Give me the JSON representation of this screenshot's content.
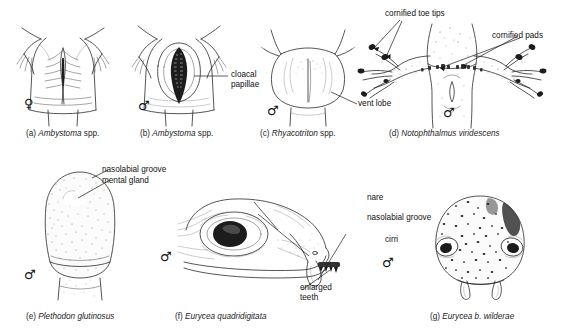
{
  "figure": {
    "background_color": "#ffffff",
    "ink_color": "#2a2a2a",
    "panel_count": 7
  },
  "panels": [
    {
      "id": "a",
      "tag": "(a)",
      "species": "Ambystoma",
      "qualifier": " spp.",
      "caption_tag": "(a)",
      "sex_symbol": "♀",
      "sex": "female",
      "labels": []
    },
    {
      "id": "b",
      "tag": "(b)",
      "species": "Ambystoma",
      "qualifier": " spp.",
      "caption_tag": "(b)",
      "sex_symbol": "♂",
      "sex": "male",
      "labels": [
        {
          "text_line1": "cloacal",
          "text_line2": "papillae",
          "full": "cloacal papillae"
        }
      ]
    },
    {
      "id": "c",
      "tag": "(c)",
      "species": "Rhyacotriton",
      "qualifier": " spp.",
      "caption_tag": "(c)",
      "sex_symbol": "♂",
      "sex": "male",
      "labels": [
        {
          "full": "vent lobe"
        }
      ]
    },
    {
      "id": "d",
      "tag": "(d)",
      "species": "Notophthalmus viridescens",
      "qualifier": "",
      "caption_tag": "(d)",
      "sex_symbol": "♂",
      "sex": "male",
      "labels": [
        {
          "full": "cornified toe tips"
        },
        {
          "full": "cornified pads"
        }
      ]
    },
    {
      "id": "e",
      "tag": "(e)",
      "species": "Plethodon glutinosus",
      "qualifier": "",
      "caption_tag": "(e)",
      "sex_symbol": "♂",
      "sex": "male",
      "labels": [
        {
          "full": "nasolabial groove"
        },
        {
          "full": "mental gland"
        }
      ]
    },
    {
      "id": "f",
      "tag": "(f)",
      "species": "Eurycea quadridigitata",
      "qualifier": "",
      "caption_tag": "(f)",
      "sex_symbol": "♂",
      "sex": "male",
      "labels": [
        {
          "full": "nare"
        },
        {
          "full": "nasolabial groove"
        },
        {
          "full": "cirri"
        },
        {
          "text_line1": "enlarged",
          "text_line2": "teeth",
          "full": "enlarged teeth"
        }
      ]
    },
    {
      "id": "g",
      "tag": "(g)",
      "species": "Eurycea b. wilderae",
      "qualifier": "",
      "caption_tag": "(g)",
      "sex_symbol": "♂",
      "sex": "male",
      "labels": []
    }
  ],
  "captions": {
    "a_tag": "(a)",
    "a_species": "Ambystoma",
    "a_suffix": " spp.",
    "b_tag": "(b)",
    "b_species": "Ambystoma",
    "b_suffix": " spp.",
    "c_tag": "(c)",
    "c_species": "Rhyacotriton",
    "c_suffix": " spp.",
    "d_tag": "(d)",
    "d_species": "Notophthalmus viridescens",
    "d_suffix": "",
    "e_tag": "(e)",
    "e_species": "Plethodon glutinosus",
    "e_suffix": "",
    "f_tag": "(f)",
    "f_species": "Eurycea quadridigitata",
    "f_suffix": "",
    "g_tag": "(g)",
    "g_species": "Eurycea b. wilderae",
    "g_suffix": ""
  },
  "annotations": {
    "cloacal_papillae_l1": "cloacal",
    "cloacal_papillae_l2": "papillae",
    "vent_lobe": "vent lobe",
    "cornified_toe_tips": "cornified toe tips",
    "cornified_pads": "cornified pads",
    "nasolabial_groove_e": "nasolabial groove",
    "mental_gland": "mental gland",
    "nare": "nare",
    "nasolabial_groove_f": "nasolabial groove",
    "cirri": "cirri",
    "enlarged_teeth_l1": "enlarged",
    "enlarged_teeth_l2": "teeth"
  },
  "sex_symbols": {
    "female": "♀",
    "male": "♂"
  }
}
